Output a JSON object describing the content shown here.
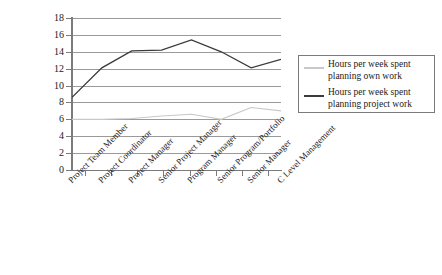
{
  "chart_data": {
    "type": "line",
    "title": "",
    "xlabel": "",
    "ylabel": "",
    "ylim": [
      0,
      18
    ],
    "ytick_step": 2,
    "yticks": [
      "0",
      "2",
      "4",
      "6",
      "8",
      "10",
      "12",
      "14",
      "16",
      "18"
    ],
    "grid": true,
    "legend_position": "right",
    "categories": [
      "Project Team Member",
      "Project Coordinator",
      "Project Manager",
      "Senior Project Manager",
      "Program Manager",
      "Senior Program/Portfolio",
      "Senior Manager",
      "C Level Management"
    ],
    "series": [
      {
        "name": "Hours per week spent planning own work",
        "color": "#c8c8c8",
        "values": [
          6.0,
          6.0,
          6.1,
          6.4,
          6.6,
          6.0,
          7.4,
          7.0
        ]
      },
      {
        "name": "Hours per week spent planning project work",
        "color": "#3a3a3a",
        "values": [
          8.6,
          12.1,
          14.1,
          14.2,
          15.4,
          14.0,
          12.1,
          13.1
        ]
      }
    ]
  },
  "legend": {
    "entries": [
      {
        "label": "Hours per week spent planning own work"
      },
      {
        "label": "Hours per week spent planning project work"
      }
    ]
  },
  "colors": {
    "axis": "#7b7b7b",
    "gridline": "#9a9a9a",
    "series_own": "#c8c8c8",
    "series_project": "#3a3a3a",
    "legend_border": "#7b7b7b",
    "background": "#ffffff"
  }
}
